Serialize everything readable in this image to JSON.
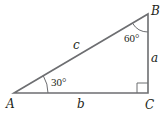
{
  "diagram": {
    "type": "right-triangle",
    "vertices": {
      "A": {
        "label": "A"
      },
      "B": {
        "label": "B"
      },
      "C": {
        "label": "C"
      }
    },
    "sides": {
      "a": {
        "label": "a",
        "between": "B-C"
      },
      "b": {
        "label": "b",
        "between": "A-C"
      },
      "c": {
        "label": "c",
        "between": "A-B"
      }
    },
    "angles": {
      "A": {
        "label": "30°"
      },
      "B": {
        "label": "60°"
      },
      "C": {
        "right_angle": true
      }
    },
    "colors": {
      "stroke": "#6d6e71",
      "text": "#231f20"
    }
  }
}
